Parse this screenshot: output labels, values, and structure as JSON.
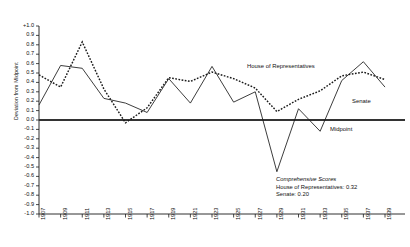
{
  "chart_data": {
    "type": "line",
    "title": "",
    "xlabel": "",
    "ylabel": "Deviation from Midpoint",
    "xlim": [
      1907,
      1939
    ],
    "ylim": [
      -1.0,
      1.0
    ],
    "grid": false,
    "legend_position": "inline-annotations",
    "x": [
      1907,
      1909,
      1911,
      1913,
      1915,
      1917,
      1919,
      1921,
      1923,
      1925,
      1927,
      1929,
      1931,
      1933,
      1935,
      1937,
      1939
    ],
    "categories": [
      "1907",
      "1909",
      "1911",
      "1913",
      "1915",
      "1917",
      "1919",
      "1921",
      "1923",
      "1925",
      "1927",
      "1929",
      "1931",
      "1933",
      "1935",
      "1937",
      "1939"
    ],
    "series": [
      {
        "name": "House of Representatives",
        "style": "dotted",
        "values": [
          0.48,
          0.35,
          0.83,
          0.33,
          -0.03,
          0.13,
          0.45,
          0.41,
          0.51,
          0.44,
          0.34,
          0.09,
          0.22,
          0.31,
          0.47,
          0.51,
          0.43
        ]
      },
      {
        "name": "Senate",
        "style": "solid",
        "values": [
          0.16,
          0.58,
          0.55,
          0.23,
          0.18,
          0.08,
          0.44,
          0.18,
          0.57,
          0.19,
          0.3,
          -0.55,
          0.12,
          -0.12,
          0.42,
          0.62,
          0.35
        ]
      }
    ],
    "reference_line": {
      "name": "Midpoint",
      "value": 0.0
    },
    "ytick_labels": [
      "+1.0",
      "0.9",
      "0.8",
      "0.7",
      "0.6",
      "0.5",
      "0.4",
      "0.3",
      "0.2",
      "0.1",
      "0.0",
      "-0.1",
      "-0.2",
      "-0.3",
      "-0.4",
      "-0.5",
      "-0.6",
      "-0.7",
      "-0.8",
      "-0.9",
      "-1.0"
    ],
    "ytick_values": [
      1.0,
      0.9,
      0.8,
      0.7,
      0.6,
      0.5,
      0.4,
      0.3,
      0.2,
      0.1,
      0.0,
      -0.1,
      -0.2,
      -0.3,
      -0.4,
      -0.5,
      -0.6,
      -0.7,
      -0.8,
      -0.9,
      -1.0
    ],
    "annotations": {
      "house_label": "House of Representatives",
      "senate_label": "Senate",
      "midpoint_label": "Midpoint",
      "scores_title": "Comprehensive Scores",
      "scores_house": "House of Representatives: 0.32",
      "scores_senate": "Senate: 0.20"
    },
    "colors": {
      "axis": "#1a1a1a",
      "house_series": "#1a1a1a",
      "senate_series": "#1a1a1a",
      "midpoint_line": "#333333",
      "background": "#ffffff"
    }
  }
}
